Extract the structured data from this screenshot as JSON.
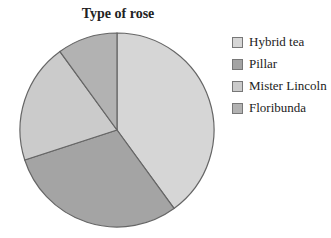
{
  "chart_data": {
    "type": "pie",
    "title": "Type of rose",
    "categories": [
      "Hybrid tea",
      "Pillar",
      "Mister Lincoln",
      "Floribunda"
    ],
    "values": [
      40,
      30,
      20,
      10
    ],
    "unit": "percent (estimated from slice angles)",
    "colors": [
      "#d6d6d6",
      "#a4a4a4",
      "#cbcbcb",
      "#b2b2b2"
    ],
    "start_angle": "12 o'clock, clockwise",
    "legend_position": "right",
    "xlabel": "",
    "ylabel": ""
  }
}
